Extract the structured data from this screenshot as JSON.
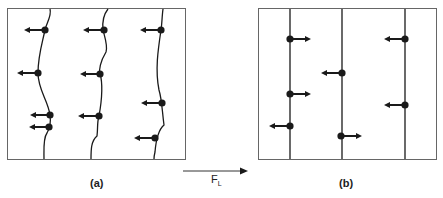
{
  "panels": [
    {
      "id": "a",
      "label": "(a)",
      "description": "Curved (pinned) flux lines with leftward pinning forces on pinning sites"
    },
    {
      "id": "b",
      "label": "(b)",
      "description": "Straight flux lines with pinning forces in mixed directions"
    }
  ],
  "force": {
    "symbol": "F",
    "subscript": "L",
    "direction": "right"
  },
  "colors": {
    "line": "#1a1a1a",
    "frame": "#555555",
    "background": "#ffffff"
  }
}
